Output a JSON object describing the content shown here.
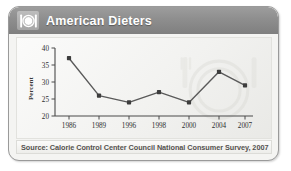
{
  "card": {
    "header": {
      "title": "American Dieters",
      "logo_icon": "plate-with-utensils-icon"
    },
    "footer": {
      "source": "Source: Calorie Control Center Council National Consumer Survey, 2007"
    }
  },
  "colors": {
    "header_bar": "#8e8e8e",
    "title_text": "#ffffff",
    "line": "#5a5a5a",
    "marker": "#3d3d3d",
    "axis": "#4a4a4a",
    "panel_bg": "#f2f2f0",
    "card_border": "#9a9a9a",
    "footer_text": "#54524f"
  },
  "chart_data": {
    "type": "line",
    "title": "American Dieters",
    "xlabel": "",
    "ylabel": "Percent",
    "categories": [
      "1986",
      "1989",
      "1996",
      "1998",
      "2000",
      "2004",
      "2007"
    ],
    "values": [
      37,
      26,
      24,
      27,
      24,
      33,
      29
    ],
    "series": [
      {
        "name": "Percent of American Dieters",
        "values": [
          37,
          26,
          24,
          27,
          24,
          33,
          29
        ]
      }
    ],
    "ylim": [
      20,
      40
    ],
    "yticks": [
      20,
      25,
      30,
      35,
      40
    ],
    "ytick_labels": [
      "20",
      "25",
      "30",
      "35",
      "40"
    ],
    "xtick_labels": [
      "1986",
      "1989",
      "1996",
      "1998",
      "2000",
      "2004",
      "2007"
    ],
    "grid": false,
    "legend": false,
    "legend_position": "none",
    "markers": "filled-square",
    "source": "Source: Calorie Control Center Council National Consumer Survey, 2007"
  }
}
